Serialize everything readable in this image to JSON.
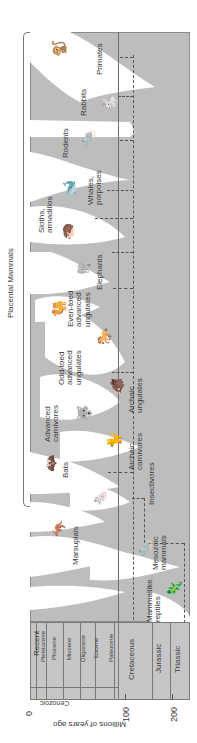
{
  "group_label": "Placental Mammals",
  "axis": {
    "label": "Millions of years ago",
    "ticks": [
      "0",
      "100",
      "200"
    ]
  },
  "geologic_scale": {
    "era_cenozoic": "Cenozoic",
    "epochs": [
      "Recent",
      "Pleistocene",
      "Pliocene",
      "Miocene",
      "Oligocene",
      "Eocene",
      "Paleocene"
    ],
    "periods": [
      "Cretaceous",
      "Jurassic",
      "Triassic"
    ]
  },
  "lineages": [
    {
      "name": "Primates",
      "line1": "Primates",
      "line2": ""
    },
    {
      "name": "Rabbits",
      "line1": "Rabbits",
      "line2": ""
    },
    {
      "name": "Rodents",
      "line1": "Rodents",
      "line2": ""
    },
    {
      "name": "Whales, porpoises",
      "line1": "Whales,",
      "line2": "porpoises"
    },
    {
      "name": "Sloths, armadillos",
      "line1": "Sloths,",
      "line2": "armadillos"
    },
    {
      "name": "Elephants",
      "line1": "Elephants",
      "line2": ""
    },
    {
      "name": "Even-toed advanced ungulates",
      "line1": "Even-toed",
      "line2": "advanced",
      "line3": "ungulates"
    },
    {
      "name": "Odd-toed advanced ungulates",
      "line1": "Odd-toed",
      "line2": "advanced",
      "line3": "ungulates"
    },
    {
      "name": "Archaic ungulates",
      "line1": "Archaic",
      "line2": "ungulates"
    },
    {
      "name": "Advanced carnivores",
      "line1": "Advanced",
      "line2": "carnivores"
    },
    {
      "name": "Bats",
      "line1": "Bats",
      "line2": ""
    },
    {
      "name": "Archaic carnivores",
      "line1": "Archaic",
      "line2": "carnivores"
    },
    {
      "name": "Insectivores",
      "line1": "Insectivores",
      "line2": ""
    },
    {
      "name": "Marsupials",
      "line1": "Marsupials",
      "line2": ""
    },
    {
      "name": "Mesozoic mammals",
      "line1": "Mesozoic",
      "line2": "mammals"
    },
    {
      "name": "Mammallike reptiles",
      "line1": "Mammallike",
      "line2": "reptiles"
    }
  ],
  "colors": {
    "panel": "#bdbdbd",
    "lineage": "#ffffff",
    "lines": "#555555"
  }
}
